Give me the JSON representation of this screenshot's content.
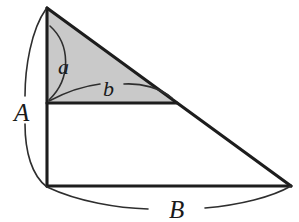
{
  "figure": {
    "background_color": "#ffffff",
    "line_color": "#1d1d1d",
    "shade_color": "#c9c9c9",
    "shade_border_color": "#1d1d1d",
    "labels": {
      "side_vertical": "A",
      "side_horizontal": "B",
      "angle_upper": "a",
      "angle_lower": "b"
    },
    "geometry": {
      "apex": [
        47,
        8
      ],
      "bottom_left": [
        47,
        186
      ],
      "bottom_right": [
        291,
        186
      ],
      "inner_base_left": [
        47,
        103
      ],
      "inner_base_right": [
        177,
        103
      ]
    },
    "label_positions": {
      "A": [
        14,
        121
      ],
      "B": [
        169,
        218
      ],
      "a": [
        58,
        74
      ],
      "b": [
        103,
        96
      ]
    }
  }
}
